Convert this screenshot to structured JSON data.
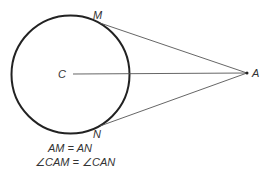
{
  "diagram": {
    "colors": {
      "stroke": "#222222",
      "line": "#555555",
      "text": "#333333"
    },
    "circle": {
      "cx": 70.5,
      "cy": 74.5,
      "r": 59
    },
    "points": {
      "C": {
        "label": "C",
        "x": 70.5,
        "y": 74.5
      },
      "M": {
        "label": "M",
        "x": 100,
        "y": 23
      },
      "N": {
        "label": "N",
        "x": 100,
        "y": 126
      },
      "A": {
        "label": "A",
        "x": 247,
        "y": 73
      }
    },
    "equations": [
      "AM = AN",
      "∠CAM = ∠CAN"
    ]
  }
}
